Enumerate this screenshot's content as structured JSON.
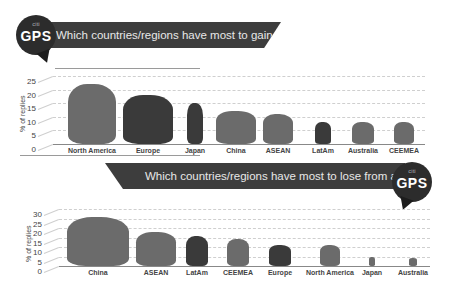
{
  "brand": {
    "citi": "citi",
    "gps": "GPS"
  },
  "chart_data": [
    {
      "type": "bar",
      "title": "Which countries/regions have most to gain from automation?",
      "xlabel": "",
      "ylabel": "% of replies",
      "ylim": [
        0,
        25
      ],
      "yticks": [
        "0",
        "5",
        "10",
        "15",
        "20",
        "25"
      ],
      "grid": true,
      "categories": [
        "North America",
        "Europe",
        "Japan",
        "China",
        "ASEAN",
        "LatAm",
        "Australia",
        "CEEMEA"
      ],
      "values": [
        22,
        18,
        15,
        12,
        11,
        8,
        8,
        8
      ],
      "note": "bars drawn as map silhouettes of each region"
    },
    {
      "type": "bar",
      "title": "Which countries/regions have most to lose from automation?",
      "xlabel": "",
      "ylabel": "% of replies",
      "ylim": [
        0,
        30
      ],
      "yticks": [
        "0",
        "5",
        "10",
        "15",
        "20",
        "25",
        "30"
      ],
      "grid": true,
      "categories": [
        "China",
        "ASEAN",
        "LatAm",
        "CEEMEA",
        "Europe",
        "North America",
        "Japan",
        "Australia"
      ],
      "values": [
        26,
        18,
        16,
        14,
        11,
        11,
        5,
        4
      ],
      "note": "bars drawn as map silhouettes of each region"
    }
  ],
  "colors": {
    "banner": "#3d3d3d",
    "map_gray": "#6b6b6b",
    "map_dark": "#3a3a3a",
    "grid": "#cfcfcf"
  }
}
